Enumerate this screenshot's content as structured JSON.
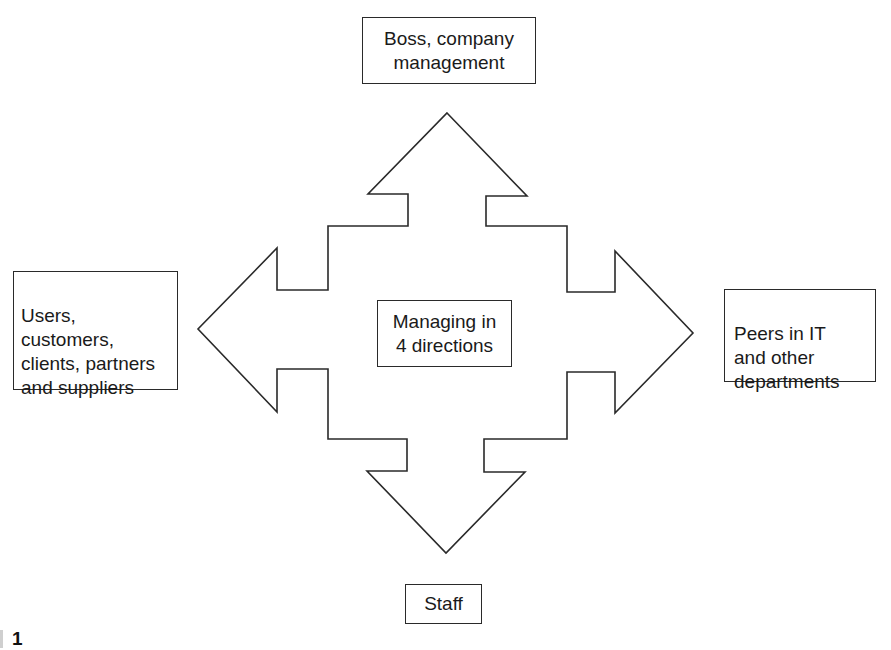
{
  "diagram": {
    "title": "Managing in 4 directions",
    "center": {
      "label": "Managing in\n4 directions"
    },
    "directions": {
      "up": {
        "label": "Boss, company\nmanagement"
      },
      "down": {
        "label": "Staff"
      },
      "left": {
        "label": "Users,\ncustomers,\nclients, partners\nand suppliers"
      },
      "right": {
        "label": "Peers in IT\nand other\ndepartments"
      }
    },
    "caption": {
      "text": "1"
    },
    "colors": {
      "stroke": "#2a2a2a",
      "background": "#ffffff",
      "text": "#1a1a1a"
    }
  }
}
